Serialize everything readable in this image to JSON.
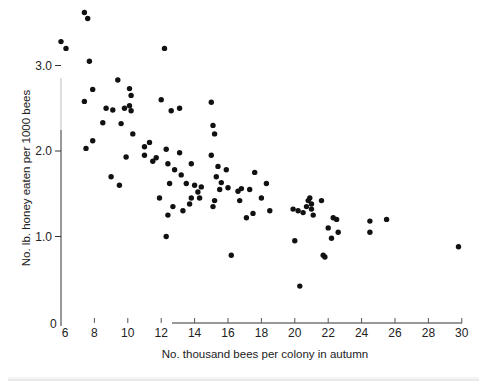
{
  "chart_data": {
    "type": "scatter",
    "title": "",
    "xlabel": "No. thousand bees per colony in autumn",
    "ylabel": "No. lb. honey eaten per 1000 bees",
    "xlim": [
      6,
      30
    ],
    "ylim": [
      0,
      3.6
    ],
    "x_ticks": [
      6,
      8,
      10,
      12,
      14,
      16,
      18,
      20,
      22,
      24,
      26,
      28,
      30
    ],
    "y_ticks": [
      0,
      1.0,
      2.0,
      3.0
    ],
    "y_tick_labels": [
      "0",
      "1.0",
      "2.0",
      "3.0"
    ],
    "grid": false,
    "legend": null,
    "points": [
      [
        6.0,
        3.28
      ],
      [
        6.3,
        3.2
      ],
      [
        7.4,
        3.62
      ],
      [
        7.6,
        3.55
      ],
      [
        7.7,
        3.05
      ],
      [
        7.4,
        2.58
      ],
      [
        7.9,
        2.72
      ],
      [
        8.5,
        2.33
      ],
      [
        8.7,
        2.5
      ],
      [
        9.1,
        2.48
      ],
      [
        9.4,
        2.83
      ],
      [
        9.6,
        2.32
      ],
      [
        9.8,
        2.5
      ],
      [
        10.1,
        2.73
      ],
      [
        10.2,
        2.65
      ],
      [
        10.1,
        2.53
      ],
      [
        10.2,
        2.47
      ],
      [
        7.5,
        2.03
      ],
      [
        7.9,
        2.12
      ],
      [
        9.0,
        1.7
      ],
      [
        9.5,
        1.6
      ],
      [
        9.9,
        1.93
      ],
      [
        10.3,
        2.2
      ],
      [
        11.0,
        2.05
      ],
      [
        11.0,
        1.95
      ],
      [
        11.3,
        2.1
      ],
      [
        11.5,
        1.88
      ],
      [
        11.7,
        1.92
      ],
      [
        11.9,
        1.45
      ],
      [
        12.0,
        2.6
      ],
      [
        12.2,
        3.2
      ],
      [
        12.3,
        2.02
      ],
      [
        12.4,
        1.85
      ],
      [
        12.5,
        1.62
      ],
      [
        12.6,
        2.47
      ],
      [
        12.4,
        1.25
      ],
      [
        12.7,
        1.35
      ],
      [
        12.3,
        1.0
      ],
      [
        12.8,
        1.78
      ],
      [
        13.1,
        1.98
      ],
      [
        13.2,
        1.72
      ],
      [
        13.1,
        2.5
      ],
      [
        13.3,
        1.3
      ],
      [
        13.5,
        1.62
      ],
      [
        13.7,
        1.38
      ],
      [
        13.8,
        1.85
      ],
      [
        14.0,
        1.6
      ],
      [
        14.2,
        1.52
      ],
      [
        14.3,
        1.45
      ],
      [
        14.4,
        1.58
      ],
      [
        13.8,
        1.45
      ],
      [
        15.0,
        2.57
      ],
      [
        15.1,
        2.3
      ],
      [
        15.2,
        2.2
      ],
      [
        15.0,
        1.95
      ],
      [
        15.3,
        1.7
      ],
      [
        15.4,
        1.82
      ],
      [
        15.6,
        1.63
      ],
      [
        15.5,
        1.55
      ],
      [
        15.2,
        1.42
      ],
      [
        15.1,
        1.35
      ],
      [
        15.9,
        1.78
      ],
      [
        16.0,
        1.57
      ],
      [
        16.2,
        0.78
      ],
      [
        16.6,
        1.53
      ],
      [
        16.8,
        1.56
      ],
      [
        16.7,
        1.42
      ],
      [
        17.1,
        1.22
      ],
      [
        17.3,
        1.55
      ],
      [
        17.5,
        1.27
      ],
      [
        17.6,
        1.75
      ],
      [
        18.0,
        1.45
      ],
      [
        18.3,
        1.62
      ],
      [
        18.5,
        1.3
      ],
      [
        19.9,
        1.32
      ],
      [
        20.0,
        0.95
      ],
      [
        20.2,
        1.3
      ],
      [
        20.5,
        1.28
      ],
      [
        20.3,
        0.42
      ],
      [
        20.7,
        1.35
      ],
      [
        20.8,
        1.42
      ],
      [
        20.9,
        1.45
      ],
      [
        21.0,
        1.38
      ],
      [
        21.0,
        1.32
      ],
      [
        21.1,
        1.25
      ],
      [
        21.6,
        1.42
      ],
      [
        21.7,
        0.78
      ],
      [
        21.8,
        0.76
      ],
      [
        22.0,
        1.1
      ],
      [
        22.2,
        0.98
      ],
      [
        22.3,
        1.22
      ],
      [
        22.5,
        1.2
      ],
      [
        22.6,
        1.05
      ],
      [
        24.5,
        1.18
      ],
      [
        24.5,
        1.05
      ],
      [
        25.5,
        1.2
      ],
      [
        29.8,
        0.88
      ]
    ]
  },
  "axes": {
    "x_tick_labels": [
      "6",
      "8",
      "10",
      "12",
      "14",
      "16",
      "18",
      "20",
      "22",
      "24",
      "26",
      "28",
      "30"
    ],
    "origin_label": "0"
  }
}
